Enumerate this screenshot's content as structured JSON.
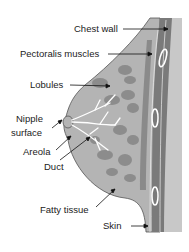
{
  "diagram": {
    "labels": [
      {
        "id": "chest-wall",
        "text": "Chest wall"
      },
      {
        "id": "pectoralis-muscles",
        "text": "Pectoralis muscles"
      },
      {
        "id": "lobules",
        "text": "Lobules"
      },
      {
        "id": "nipple-surface-1",
        "text": "Nipple"
      },
      {
        "id": "nipple-surface-2",
        "text": "surface"
      },
      {
        "id": "areola",
        "text": "Areola"
      },
      {
        "id": "duct",
        "text": "Duct"
      },
      {
        "id": "fatty-tissue",
        "text": "Fatty tissue"
      },
      {
        "id": "skin",
        "text": "Skin"
      }
    ],
    "colors": {
      "tissue": "#b4b4b4",
      "lobule": "#8c8c8c",
      "muscle": "#7a7a7a",
      "wall": "#c8c8c8",
      "duct": "#ffffff",
      "text": "#222222"
    }
  }
}
